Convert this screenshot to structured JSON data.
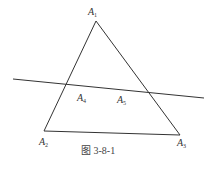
{
  "figure": {
    "caption": "图 3-8-1",
    "points": [
      {
        "id": "A1",
        "base": "A",
        "sub": "1"
      },
      {
        "id": "A2",
        "base": "A",
        "sub": "2"
      },
      {
        "id": "A3",
        "base": "A",
        "sub": "3"
      },
      {
        "id": "A4",
        "base": "A",
        "sub": "4"
      },
      {
        "id": "A5",
        "base": "A",
        "sub": "5"
      }
    ],
    "shapes": {
      "triangle": "A1 A2 A3",
      "line": "secant through A4 and A5 crossing sides A1A2 and A1A3"
    },
    "colors": {
      "stroke": "#333333",
      "background": "#ffffff"
    }
  }
}
